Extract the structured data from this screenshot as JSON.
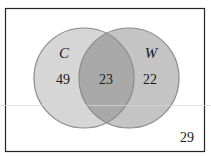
{
  "diagram": {
    "type": "venn",
    "sets": [
      {
        "name": "C",
        "only_count": "49",
        "fill": "#d6d6d6"
      },
      {
        "name": "W",
        "only_count": "22",
        "fill": "#c4c4c4"
      }
    ],
    "intersection_count": "23",
    "outside_count": "29",
    "colors": {
      "border": "#222222",
      "circle_stroke": "#8a8a8a",
      "overlap_fill": "#a9a9a9",
      "background": "#ffffff"
    }
  }
}
